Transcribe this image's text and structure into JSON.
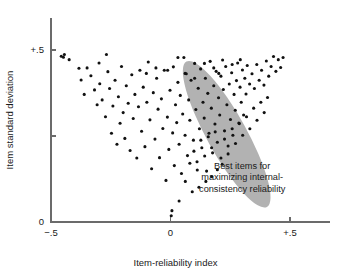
{
  "chart_data": {
    "type": "scatter",
    "title": "",
    "xlabel": "Item-reliability index",
    "ylabel": "Item standard deviation",
    "xlim": [
      -0.5,
      0.5
    ],
    "ylim": [
      0.0,
      0.5
    ],
    "grid": false,
    "legend": null,
    "x_ticks": [
      {
        "value": -0.5,
        "label": "−.5"
      },
      {
        "value": 0.0,
        "label": "0"
      },
      {
        "value": 0.5,
        "label": "+.5"
      }
    ],
    "y_ticks": [
      {
        "value": 0.0,
        "label": "0"
      },
      {
        "value": 0.25,
        "label": ""
      },
      {
        "value": 0.5,
        "label": "+.5"
      }
    ],
    "annotations": [
      {
        "name": "best-items-callout",
        "lines": [
          "Best items for",
          "maximizing internal-",
          "consistency reliability"
        ],
        "x": 0.3,
        "y": 0.155
      }
    ],
    "shapes": [
      {
        "type": "ellipse",
        "name": "best-items-region",
        "color": "#b2b2b2",
        "center_x": 0.235,
        "center_y": 0.255,
        "semi_major": 0.285,
        "semi_minor": 0.068,
        "rotation_deg": -61
      }
    ],
    "marker": {
      "shape": "circle",
      "color": "#111111",
      "size_px": 3.1
    },
    "points": [
      [
        -0.457,
        0.482
      ],
      [
        -0.448,
        0.479
      ],
      [
        -0.444,
        0.487
      ],
      [
        -0.424,
        0.472
      ],
      [
        -0.383,
        0.447
      ],
      [
        -0.374,
        0.413
      ],
      [
        -0.361,
        0.371
      ],
      [
        -0.349,
        0.448
      ],
      [
        -0.333,
        0.425
      ],
      [
        -0.318,
        0.384
      ],
      [
        -0.307,
        0.341
      ],
      [
        -0.299,
        0.462
      ],
      [
        -0.296,
        0.402
      ],
      [
        -0.286,
        0.355
      ],
      [
        -0.272,
        0.306
      ],
      [
        -0.268,
        0.487
      ],
      [
        -0.262,
        0.437
      ],
      [
        -0.255,
        0.388
      ],
      [
        -0.247,
        0.258
      ],
      [
        -0.241,
        0.337
      ],
      [
        -0.232,
        0.412
      ],
      [
        -0.224,
        0.226
      ],
      [
        -0.218,
        0.364
      ],
      [
        -0.211,
        0.287
      ],
      [
        -0.205,
        0.452
      ],
      [
        -0.198,
        0.318
      ],
      [
        -0.191,
        0.243
      ],
      [
        -0.185,
        0.396
      ],
      [
        -0.177,
        0.345
      ],
      [
        -0.169,
        0.208
      ],
      [
        -0.162,
        0.428
      ],
      [
        -0.156,
        0.301
      ],
      [
        -0.149,
        0.371
      ],
      [
        -0.141,
        0.186
      ],
      [
        -0.134,
        0.335
      ],
      [
        -0.128,
        0.441
      ],
      [
        -0.121,
        0.264
      ],
      [
        -0.114,
        0.392
      ],
      [
        -0.107,
        0.219
      ],
      [
        -0.099,
        0.348
      ],
      [
        -0.093,
        0.465
      ],
      [
        -0.086,
        0.297
      ],
      [
        -0.079,
        0.155
      ],
      [
        -0.072,
        0.376
      ],
      [
        -0.065,
        0.241
      ],
      [
        -0.058,
        0.418
      ],
      [
        -0.052,
        0.328
      ],
      [
        -0.046,
        0.187
      ],
      [
        -0.038,
        0.358
      ],
      [
        -0.032,
        0.272
      ],
      [
        -0.026,
        0.441
      ],
      [
        -0.019,
        0.121
      ],
      [
        -0.013,
        0.305
      ],
      [
        -0.007,
        0.211
      ],
      [
        -0.002,
        0.383
      ],
      [
        0.003,
        0.018
      ],
      [
        0.006,
        0.033
      ],
      [
        0.009,
        0.259
      ],
      [
        0.012,
        0.451
      ],
      [
        0.016,
        0.164
      ],
      [
        0.021,
        0.341
      ],
      [
        0.026,
        0.289
      ],
      [
        0.031,
        0.406
      ],
      [
        0.036,
        0.226
      ],
      [
        0.041,
        0.368
      ],
      [
        0.046,
        0.141
      ],
      [
        0.051,
        0.314
      ],
      [
        0.056,
        0.478
      ],
      [
        0.061,
        0.252
      ],
      [
        0.066,
        0.431
      ],
      [
        0.071,
        0.193
      ],
      [
        0.076,
        0.355
      ],
      [
        0.081,
        0.296
      ],
      [
        0.086,
        0.412
      ],
      [
        0.091,
        0.088
      ],
      [
        0.096,
        0.238
      ],
      [
        0.101,
        0.461
      ],
      [
        0.106,
        0.327
      ],
      [
        0.111,
        0.175
      ],
      [
        0.116,
        0.389
      ],
      [
        0.121,
        0.271
      ],
      [
        0.126,
        0.445
      ],
      [
        0.131,
        0.216
      ],
      [
        0.136,
        0.348
      ],
      [
        0.141,
        0.302
      ],
      [
        0.146,
        0.418
      ],
      [
        0.151,
        0.148
      ],
      [
        0.156,
        0.374
      ],
      [
        0.161,
        0.258
      ],
      [
        0.166,
        0.467
      ],
      [
        0.171,
        0.331
      ],
      [
        0.176,
        0.201
      ],
      [
        0.181,
        0.396
      ],
      [
        0.186,
        0.285
      ],
      [
        0.191,
        0.438
      ],
      [
        0.196,
        0.232
      ],
      [
        0.201,
        0.361
      ],
      [
        0.206,
        0.311
      ],
      [
        0.211,
        0.424
      ],
      [
        0.216,
        0.168
      ],
      [
        0.221,
        0.385
      ],
      [
        0.226,
        0.265
      ],
      [
        0.231,
        0.452
      ],
      [
        0.236,
        0.341
      ],
      [
        0.241,
        0.221
      ],
      [
        0.246,
        0.401
      ],
      [
        0.251,
        0.298
      ],
      [
        0.256,
        0.434
      ],
      [
        0.261,
        0.252
      ],
      [
        0.266,
        0.371
      ],
      [
        0.271,
        0.325
      ],
      [
        0.276,
        0.411
      ],
      [
        0.281,
        0.462
      ],
      [
        0.286,
        0.288
      ],
      [
        0.291,
        0.392
      ],
      [
        0.296,
        0.348
      ],
      [
        0.301,
        0.442
      ],
      [
        0.306,
        0.311
      ],
      [
        0.311,
        0.418
      ],
      [
        0.316,
        0.372
      ],
      [
        0.321,
        0.455
      ],
      [
        0.331,
        0.401
      ],
      [
        0.341,
        0.431
      ],
      [
        0.351,
        0.388
      ],
      [
        0.361,
        0.458
      ],
      [
        0.371,
        0.412
      ],
      [
        0.381,
        0.441
      ],
      [
        0.391,
        0.398
      ],
      [
        0.401,
        0.468
      ],
      [
        0.411,
        0.424
      ],
      [
        0.421,
        0.452
      ],
      [
        0.431,
        0.481
      ],
      [
        0.441,
        0.438
      ],
      [
        0.451,
        0.472
      ],
      [
        0.461,
        0.449
      ],
      [
        0.471,
        0.478
      ],
      [
        0.036,
        0.061
      ],
      [
        0.062,
        0.118
      ],
      [
        0.081,
        0.171
      ],
      [
        0.098,
        0.206
      ],
      [
        0.112,
        0.151
      ],
      [
        0.127,
        0.238
      ],
      [
        0.143,
        0.192
      ],
      [
        0.158,
        0.248
      ],
      [
        0.172,
        0.216
      ],
      [
        0.187,
        0.262
      ],
      [
        0.148,
        0.118
      ],
      [
        0.119,
        0.101
      ],
      [
        0.211,
        0.186
      ],
      [
        0.226,
        0.241
      ],
      [
        0.241,
        0.198
      ],
      [
        0.258,
        0.271
      ],
      [
        0.196,
        0.152
      ],
      [
        0.172,
        0.132
      ],
      [
        0.272,
        0.228
      ],
      [
        0.288,
        0.286
      ],
      [
        0.302,
        0.252
      ],
      [
        0.318,
        0.306
      ],
      [
        0.332,
        0.271
      ],
      [
        0.348,
        0.331
      ],
      [
        0.362,
        0.296
      ],
      [
        0.378,
        0.348
      ],
      [
        0.392,
        0.318
      ],
      [
        0.406,
        0.362
      ],
      [
        -0.012,
        0.441
      ],
      [
        0.031,
        0.478
      ],
      [
        0.142,
        0.461
      ],
      [
        0.218,
        0.471
      ],
      [
        0.258,
        0.458
      ],
      [
        0.292,
        0.472
      ],
      [
        -0.061,
        0.448
      ],
      [
        -0.101,
        0.432
      ],
      [
        0.061,
        0.432
      ],
      [
        0.101,
        0.418
      ],
      [
        0.181,
        0.448
      ],
      [
        0.202,
        0.432
      ]
    ]
  }
}
